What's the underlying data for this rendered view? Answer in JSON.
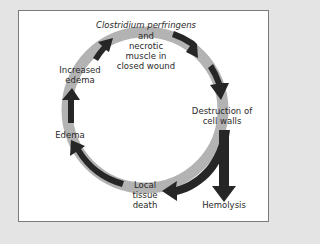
{
  "diagram": {
    "type": "cycle",
    "colors": {
      "background": "#e4e4e4",
      "panel": "#ffffff",
      "panel_border": "#7a7a7a",
      "ring": "#b3b3b3",
      "arrow": "#262626",
      "text": "#2a2a2a"
    },
    "nodes": {
      "start": {
        "title": "Clostridium perfringens",
        "line2": "and",
        "line3": "necrotic",
        "line4": "muscle in",
        "line5": "closed wound"
      },
      "destruction": {
        "line1": "Destruction of",
        "line2": "cell walls"
      },
      "hemolysis": {
        "label": "Hemolysis"
      },
      "local_death": {
        "line1": "Local",
        "line2": "tissue",
        "line3": "death"
      },
      "edema": {
        "label": "Edema"
      },
      "increased_edema": {
        "line1": "Increased",
        "line2": "edema"
      }
    },
    "edges": [
      {
        "from": "Clostridium perfringens and necrotic muscle in closed wound",
        "to": "Destruction of cell walls"
      },
      {
        "from": "Destruction of cell walls",
        "to": "Hemolysis"
      },
      {
        "from": "Destruction of cell walls",
        "to": "Local tissue death"
      },
      {
        "from": "Local tissue death",
        "to": "Edema"
      },
      {
        "from": "Edema",
        "to": "Increased edema"
      },
      {
        "from": "Increased edema",
        "to": "Clostridium perfringens and necrotic muscle in closed wound"
      }
    ]
  }
}
